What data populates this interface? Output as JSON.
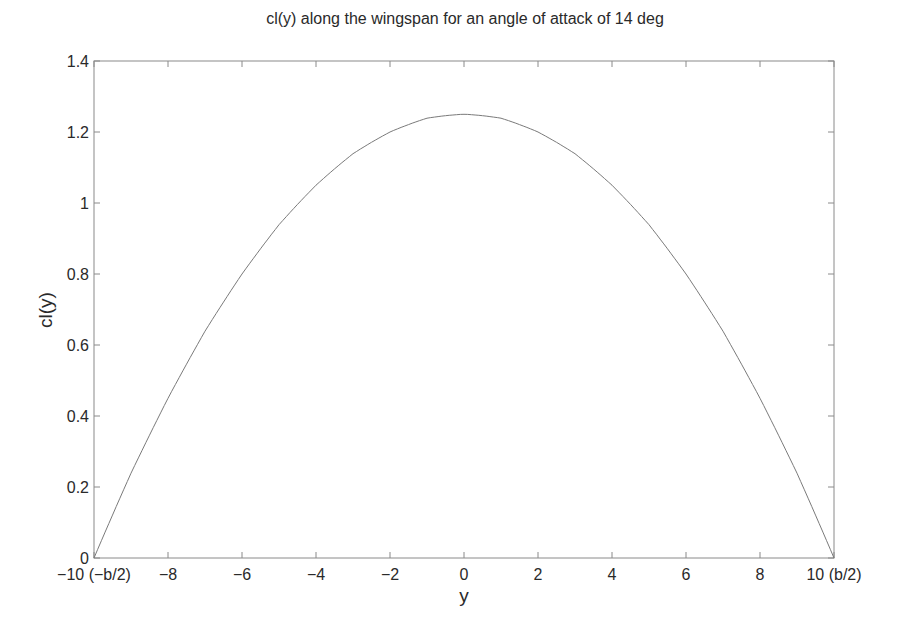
{
  "chart_data": {
    "type": "line",
    "title": "cl(y) along the wingspan for an angle of attack of 14 deg",
    "xlabel": "y",
    "ylabel": "cl(y)",
    "xlim": [
      -10,
      10
    ],
    "ylim": [
      0,
      1.4
    ],
    "grid": false,
    "legend": null,
    "x_ticks": [
      -10,
      -8,
      -6,
      -4,
      -2,
      0,
      2,
      4,
      6,
      8,
      10
    ],
    "x_tick_labels": [
      "−10 (−b/2)",
      "−8",
      "−6",
      "−4",
      "−2",
      "0",
      "2",
      "4",
      "6",
      "8",
      "10 (b/2)"
    ],
    "y_ticks": [
      0,
      0.2,
      0.4,
      0.6,
      0.8,
      1,
      1.2,
      1.4
    ],
    "y_tick_labels": [
      "0",
      "0.2",
      "0.4",
      "0.6",
      "0.8",
      "1",
      "1.2",
      "1.4"
    ],
    "series": [
      {
        "name": "cl(y)",
        "color": "#7a7a7a",
        "x": [
          -10,
          -9,
          -8,
          -7,
          -6,
          -5,
          -4,
          -3,
          -2,
          -1,
          0,
          1,
          2,
          3,
          4,
          5,
          6,
          7,
          8,
          9,
          10
        ],
        "values": [
          0,
          0.24,
          0.45,
          0.64,
          0.8,
          0.94,
          1.05,
          1.14,
          1.2,
          1.24,
          1.25,
          1.24,
          1.2,
          1.14,
          1.05,
          0.94,
          0.8,
          0.64,
          0.45,
          0.24,
          0
        ]
      }
    ]
  }
}
